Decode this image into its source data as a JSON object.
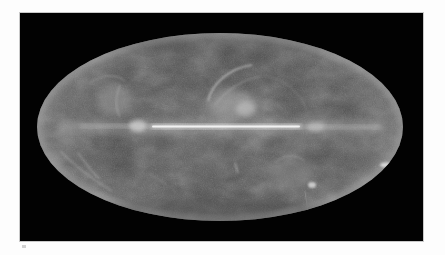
{
  "image": {
    "subject": "all-sky map, Mollweide projection, grayscale",
    "frame": {
      "background": "#020202",
      "border": "#c9c9c9"
    },
    "sky_ellipse": {
      "cx": 200,
      "cy": 114,
      "rx": 183,
      "ry": 94,
      "base_color": "#4a4a4a",
      "edge_glow": "#8c8c8c"
    },
    "galactic_plane": {
      "color": "#f2f2f2",
      "x_start": 130,
      "x_end": 282,
      "y": 114
    },
    "features": [
      {
        "name": "north-polar-spur-loop",
        "color": "#a8a8a8"
      },
      {
        "name": "left-upper-cloud",
        "color": "#9a9a9a"
      },
      {
        "name": "lower-right-cloud",
        "color": "#a0a0a0"
      },
      {
        "name": "lower-left-filaments",
        "color": "#8f8f8f"
      },
      {
        "name": "right-edge-knot",
        "color": "#d8d8d8"
      }
    ]
  },
  "page": {
    "background": "#fdfdfd"
  }
}
